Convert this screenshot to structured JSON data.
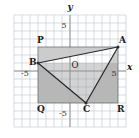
{
  "figure": {
    "type": "coordinate-geometry-diagram",
    "background_color": "#ffffff",
    "grid_color": "#b9c6d6",
    "axis_color": "#8a8a8a",
    "shade_color_light": "#c9c9c9",
    "shade_color_dark": "#9e9e9e",
    "stroke_color": "#2a2a2a"
  },
  "axes": {
    "x_label": "x",
    "y_label": "y",
    "x_ticks": [
      {
        "label": "-5",
        "value": -5
      },
      {
        "label": "5",
        "value": 5
      }
    ],
    "y_ticks": [
      {
        "label": "5",
        "value": 5
      },
      {
        "label": "-5",
        "value": -5
      }
    ],
    "origin_label": "O",
    "x_range": [
      -7,
      7
    ],
    "y_range": [
      -7,
      7
    ],
    "grid_step": 1
  },
  "points": [
    {
      "name": "P",
      "label": "P",
      "x": -4,
      "y": 3,
      "label_pos": "upper-left",
      "dot": false
    },
    {
      "name": "A",
      "label": "A",
      "x": 6,
      "y": 3,
      "label_pos": "upper-right",
      "dot": true
    },
    {
      "name": "B",
      "label": "B",
      "x": -4,
      "y": 1,
      "label_pos": "left",
      "dot": true
    },
    {
      "name": "C",
      "label": "C",
      "x": 2,
      "y": -4,
      "label_pos": "below",
      "dot": true
    },
    {
      "name": "Q",
      "label": "Q",
      "x": -4,
      "y": -4,
      "label_pos": "lower-left",
      "dot": false
    },
    {
      "name": "R",
      "label": "R",
      "x": 6,
      "y": -4,
      "label_pos": "lower-right",
      "dot": false
    }
  ],
  "shapes": [
    {
      "name": "rectangle-PQRA",
      "kind": "polygon",
      "vertices": [
        "P",
        "Q",
        "R",
        "A"
      ],
      "fill": "shaded",
      "stroke": false
    },
    {
      "name": "triangle-ABC",
      "kind": "polygon",
      "vertices": [
        "A",
        "B",
        "C"
      ],
      "fill": "white",
      "stroke": true
    }
  ],
  "chart_data": {
    "type": "scatter",
    "title": "",
    "xlabel": "x",
    "ylabel": "y",
    "xlim": [
      -7,
      7
    ],
    "ylim": [
      -7,
      7
    ],
    "grid": true,
    "legend": "none",
    "annotations": [
      {
        "text": "P",
        "x": -4,
        "y": 3
      },
      {
        "text": "A",
        "x": 6,
        "y": 3
      },
      {
        "text": "B",
        "x": -4,
        "y": 1
      },
      {
        "text": "C",
        "x": 2,
        "y": -4
      },
      {
        "text": "Q",
        "x": -4,
        "y": -4
      },
      {
        "text": "R",
        "x": 6,
        "y": -4
      },
      {
        "text": "O",
        "x": 0,
        "y": 0
      },
      {
        "text": "5",
        "x": 0,
        "y": 5
      },
      {
        "text": "-5",
        "x": 0,
        "y": -5
      },
      {
        "text": "-5",
        "x": -5,
        "y": 0
      },
      {
        "text": "5",
        "x": 5,
        "y": 0
      }
    ],
    "series": [
      {
        "name": "rectangle-PQRA",
        "x": [
          -4,
          -4,
          6,
          6,
          -4
        ],
        "y": [
          3,
          -4,
          -4,
          3,
          3
        ]
      },
      {
        "name": "triangle-ABC",
        "x": [
          6,
          -4,
          2,
          6
        ],
        "y": [
          3,
          1,
          -4,
          3
        ]
      }
    ]
  }
}
